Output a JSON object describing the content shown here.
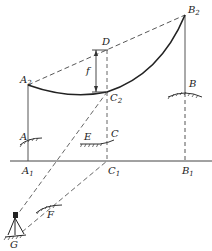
{
  "diagram": {
    "labels": {
      "B2": {
        "main": "B",
        "sub": "2"
      },
      "D": {
        "main": "D"
      },
      "f": {
        "main": "f"
      },
      "A2": {
        "main": "A",
        "sub": "2"
      },
      "C2": {
        "main": "C",
        "sub": "2"
      },
      "B": {
        "main": "B"
      },
      "A": {
        "main": "A"
      },
      "E": {
        "main": "E"
      },
      "C": {
        "main": "C"
      },
      "A1": {
        "main": "A",
        "sub": "1"
      },
      "C1": {
        "main": "C",
        "sub": "1"
      },
      "B1": {
        "main": "B",
        "sub": "1"
      },
      "F": {
        "main": "F"
      },
      "G": {
        "main": "G"
      }
    },
    "colors": {
      "line": "#333333",
      "background": "#ffffff"
    }
  }
}
